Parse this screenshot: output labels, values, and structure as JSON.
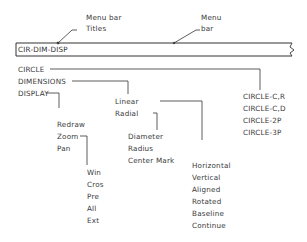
{
  "callouts": {
    "menu_bar_titles": [
      "Menu  bar",
      "Titles"
    ],
    "menu_bar": [
      "Menu",
      "bar"
    ]
  },
  "menu_bar": {
    "text": "CIR-DIM-DISP"
  },
  "menu_titles": [
    {
      "label": "CIRCLE",
      "items": [
        "CIRCLE-C,R",
        "CIRCLE-C,D",
        "CIRCLE-2P",
        "CIRCLE-3P"
      ]
    },
    {
      "label": "DIMENSIONS",
      "items": [
        "Linear",
        "Radial"
      ]
    },
    {
      "label": "DISPLAY",
      "items": [
        "Redraw",
        "Zoom",
        "Pan"
      ]
    }
  ],
  "submenus": {
    "linear": [
      "Horizontal",
      "Vertical",
      "Aligned",
      "Rotated",
      "Baseline",
      "Continue"
    ],
    "radial": [
      "Diameter",
      "Radius",
      "Center  Mark"
    ],
    "zoom": [
      "Win",
      "Cros",
      "Pre",
      "All",
      "Ext"
    ]
  },
  "colors": {
    "line": "#333333",
    "background": "#ffffff"
  }
}
